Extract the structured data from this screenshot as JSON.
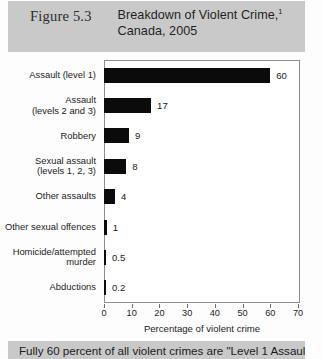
{
  "header": {
    "figure_number": "Figure 5.3",
    "title_line1": "Breakdown of Violent Crime,",
    "title_footnote_marker": "1",
    "title_line2": "Canada, 2005",
    "band_color": "#c9c9c9"
  },
  "footer": {
    "text": "Fully 60 percent of all violent crimes are \"Level 1 Assaults.\"",
    "band_color": "#c9c9c9"
  },
  "chart_data": {
    "type": "bar",
    "orientation": "horizontal",
    "xlabel": "Percentage of violent crime",
    "ylabel": "",
    "xlim": [
      0,
      70
    ],
    "xticks": [
      0,
      10,
      20,
      30,
      40,
      50,
      60,
      70
    ],
    "grid": false,
    "legend": false,
    "bar_color": "#0b0b0b",
    "categories": [
      "Assault (level 1)",
      "Assault (levels 2 and 3)",
      "Robbery",
      "Sexual assault (levels 1, 2, 3)",
      "Other assaults",
      "Other sexual offences",
      "Homicide/attempted murder",
      "Abductions"
    ],
    "category_lines": [
      [
        "Assault (level 1)"
      ],
      [
        "Assault",
        "(levels 2 and 3)"
      ],
      [
        "Robbery"
      ],
      [
        "Sexual assault",
        "(levels 1, 2, 3)"
      ],
      [
        "Other assaults"
      ],
      [
        "Other sexual offences"
      ],
      [
        "Homicide/attempted",
        "murder"
      ],
      [
        "Abductions"
      ]
    ],
    "values": [
      60,
      17,
      9,
      8,
      4,
      1,
      0.5,
      0.2
    ],
    "value_labels": [
      "60",
      "17",
      "9",
      "8",
      "4",
      "1",
      "0.5",
      "0.2"
    ]
  }
}
